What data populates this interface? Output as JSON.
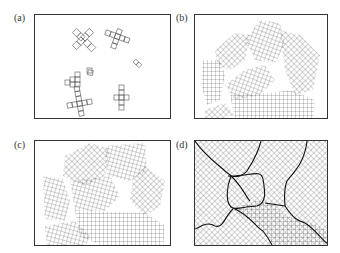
{
  "figure": {
    "panels": [
      {
        "id": "a",
        "label": "(a)",
        "description": "Isolated small crystallite clusters (nuclei) scattered in an empty box"
      },
      {
        "id": "b",
        "label": "(b)",
        "description": "Growing grid-patterned crystallites of various orientations, partially filling the box"
      },
      {
        "id": "c",
        "label": "(c)",
        "description": "Crystallites nearly filling the box, impinging on one another"
      },
      {
        "id": "d",
        "label": "(d)",
        "description": "Fully filled box with grains separated by irregular grain boundaries"
      }
    ]
  }
}
